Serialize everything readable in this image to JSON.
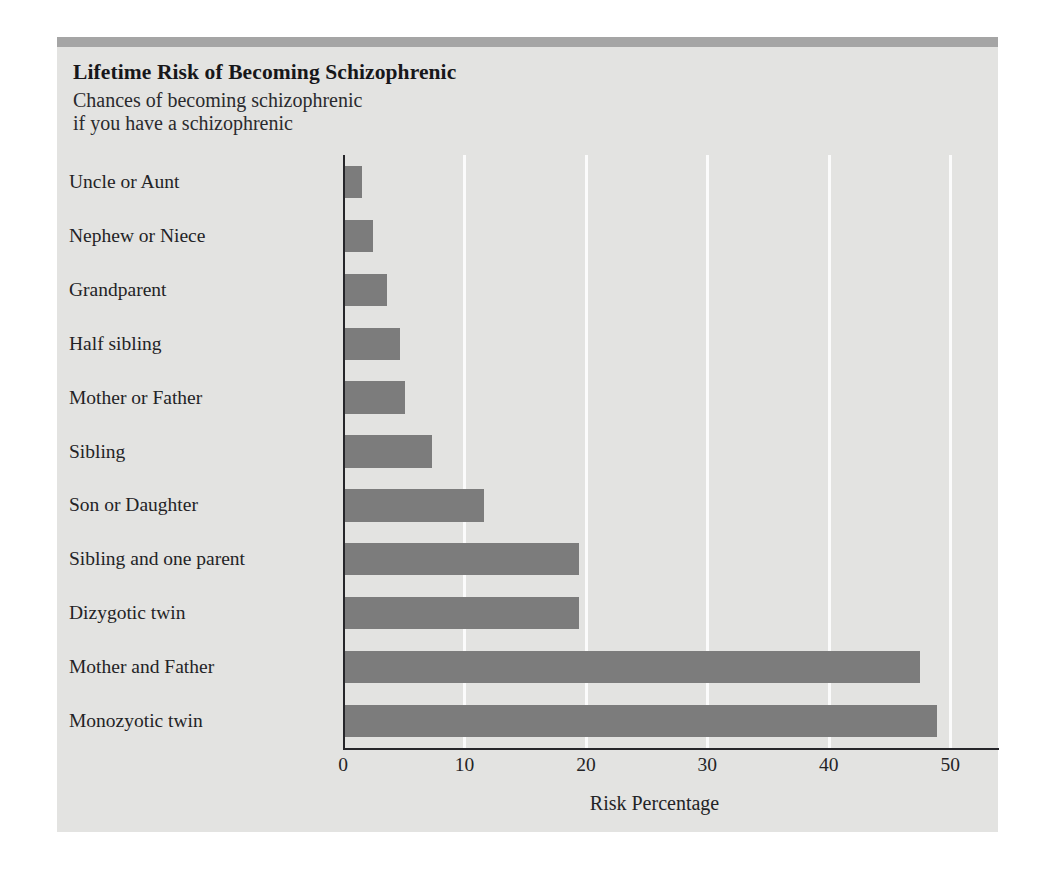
{
  "figure": {
    "title": "Lifetime Risk of Becoming Schizophrenic",
    "subtitle": "Chances of becoming schizophrenic\nif you have a schizophrenic",
    "background_color": "#e3e3e1",
    "band_color": "#a5a5a5",
    "bar_color": "#7c7c7c",
    "gridline_color": "#fbfbfb",
    "axis_color": "#26262a",
    "text_color": "#232326"
  },
  "chart_data": {
    "type": "bar",
    "orientation": "horizontal",
    "title": "Lifetime Risk of Becoming Schizophrenic",
    "subtitle": "Chances of becoming schizophrenic if you have a schizophrenic",
    "xlabel": "Risk Percentage",
    "ylabel": "",
    "xlim": [
      0,
      51.3
    ],
    "xticks": [
      0,
      10,
      20,
      30,
      40,
      50
    ],
    "xticklabels": [
      "0",
      "10",
      "20",
      "30",
      "40",
      "50"
    ],
    "grid": "vertical-only",
    "legend": "none",
    "categories": [
      "Uncle or Aunt",
      "Nephew or Niece",
      "Grandparent",
      "Half sibling",
      "Mother or Father",
      "Sibling",
      "Son or Daughter",
      "Sibling and one parent",
      "Dizygotic twin",
      "Mother and Father",
      "Monozyotic twin"
    ],
    "values": [
      1.6,
      2.5,
      3.6,
      4.7,
      5.1,
      7.3,
      11.6,
      19.4,
      19.4,
      47.5,
      48.9
    ],
    "series": [
      {
        "name": "Risk Percentage",
        "values": [
          1.6,
          2.5,
          3.6,
          4.7,
          5.1,
          7.3,
          11.6,
          19.4,
          19.4,
          47.5,
          48.9
        ]
      }
    ]
  }
}
